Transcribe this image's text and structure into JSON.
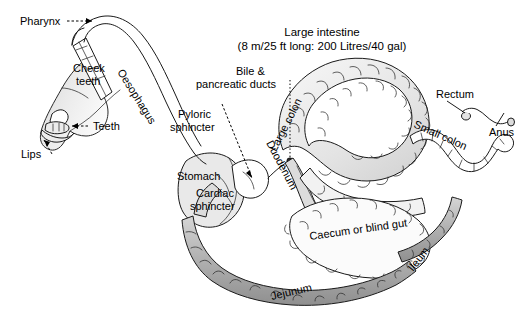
{
  "figure": {
    "background_color": "#ffffff",
    "outline_color": "#1a1a1a",
    "fill_light": "#ececec",
    "fill_mid": "#c9c9c9",
    "fill_dark": "#a9a9a9",
    "width": 523,
    "height": 312
  },
  "labels": {
    "pharynx": "Pharynx",
    "cheek_teeth_line1": "Cheek",
    "cheek_teeth_line2": "teeth",
    "teeth": "Teeth",
    "lips": "Lips",
    "oesophagus": "Oesophagus",
    "pyloric_sphincter_line1": "Pyloric",
    "pyloric_sphincter_line2": "sphincter",
    "bile_ducts_line1": "Bile &",
    "bile_ducts_line2": "pancreatic ducts",
    "stomach": "Stomach",
    "cardiac_sphincter_line1": "Cardiac",
    "cardiac_sphincter_line2": "sphincter",
    "duodenum": "Duodenum",
    "large_intestine_title": "Large intestine",
    "large_intestine_subtitle": "(8 m/25 ft long: 200 Litres/40 gal)",
    "large_colon": "Large colon",
    "small_colon": "Small colon",
    "rectum": "Rectum",
    "anus": "Anus",
    "caecum": "Caecum or blind gut",
    "ileum": "Ileum",
    "jejunum": "Jejunum"
  },
  "measurements": {
    "large_intestine_length_metric": "8 m",
    "large_intestine_length_imperial": "25 ft",
    "large_intestine_capacity_metric": "200 Litres",
    "large_intestine_capacity_imperial": "40 gal"
  },
  "icons": {
    "pharynx_pointer": "dashed-arrow-icon",
    "teeth_pointer": "dashed-arrow-icon",
    "lips_pointer": "dashed-arrow-icon",
    "bile_pointer": "dotted-leader-icon",
    "pyloric_pointer": "dashed-arrow-icon",
    "rectum_pointer": "solid-leader-icon",
    "anus_pointer": "solid-leader-icon"
  }
}
